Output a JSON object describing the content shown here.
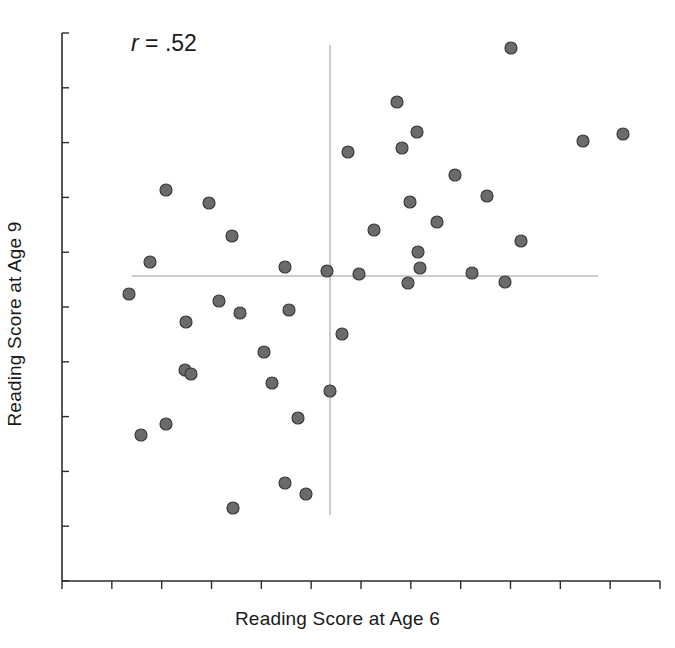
{
  "chart_data": {
    "type": "scatter",
    "title": "",
    "xlabel": "Reading Score at Age 6",
    "ylabel": "Reading Score at Age 9",
    "annotation": "r = .52",
    "annotation_symbol": "r",
    "annotation_value": " = .52",
    "correlation": 0.52,
    "n_points": 58,
    "grid": false,
    "legend": false,
    "axis_ticks_labeled": false,
    "xlim": [
      0,
      100
    ],
    "ylim": [
      0,
      100
    ],
    "marker": {
      "shape": "circle",
      "fill_color": "#6b6b6b",
      "edge_color": "#3a3a3a",
      "size_px": 12
    },
    "reference_lines": [
      {
        "name": "mean-y-line",
        "orientation": "horizontal",
        "value_px_y": 276,
        "x_start_px": 132,
        "x_end_px": 598,
        "color": "#9a9a9a"
      },
      {
        "name": "mean-x-line",
        "orientation": "vertical",
        "value_px_x": 330,
        "y_start_px": 45,
        "y_end_px": 515,
        "color": "#9a9a9a"
      }
    ],
    "axes_px": {
      "x_axis_y": 581,
      "x_axis_start": 62,
      "x_axis_end": 660,
      "y_axis_x": 62,
      "y_axis_start": 33,
      "y_axis_end": 581,
      "x_tick_count": 13,
      "y_tick_count": 11
    },
    "points_px": [
      [
        511,
        48
      ],
      [
        397,
        102
      ],
      [
        417,
        132
      ],
      [
        348,
        152
      ],
      [
        402,
        148
      ],
      [
        583,
        141
      ],
      [
        623,
        134
      ],
      [
        166,
        190
      ],
      [
        209,
        203
      ],
      [
        487,
        196
      ],
      [
        455,
        175
      ],
      [
        374,
        230
      ],
      [
        437,
        222
      ],
      [
        410,
        202
      ],
      [
        232,
        236
      ],
      [
        521,
        241
      ],
      [
        285,
        267
      ],
      [
        150,
        262
      ],
      [
        327,
        271
      ],
      [
        359,
        274
      ],
      [
        418,
        252
      ],
      [
        420,
        268
      ],
      [
        408,
        283
      ],
      [
        472,
        273
      ],
      [
        505,
        282
      ],
      [
        129,
        294
      ],
      [
        219,
        301
      ],
      [
        240,
        313
      ],
      [
        289,
        310
      ],
      [
        186,
        322
      ],
      [
        342,
        334
      ],
      [
        264,
        352
      ],
      [
        185,
        370
      ],
      [
        191,
        374
      ],
      [
        272,
        383
      ],
      [
        330,
        391
      ],
      [
        166,
        424
      ],
      [
        141,
        435
      ],
      [
        298,
        418
      ],
      [
        285,
        483
      ],
      [
        306,
        494
      ],
      [
        233,
        508
      ]
    ]
  }
}
